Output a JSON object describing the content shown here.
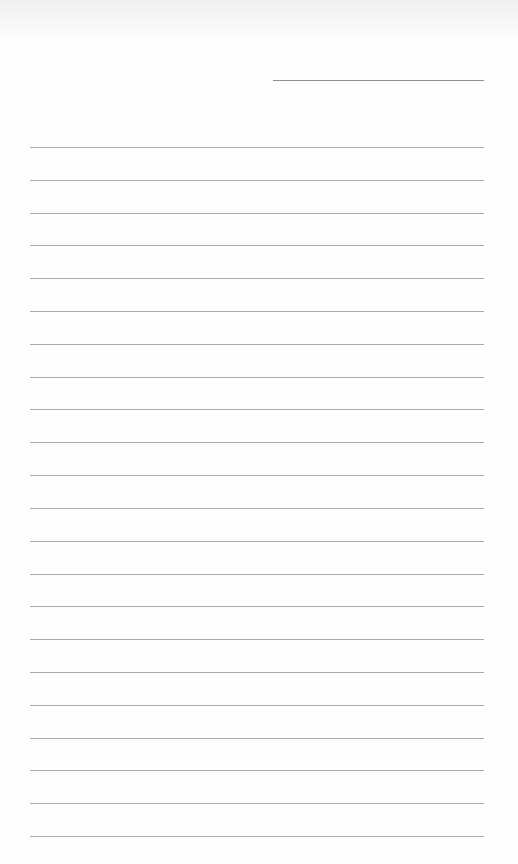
{
  "page": {
    "type": "lined-paper",
    "header_line_count": 1,
    "ruled_line_count": 22,
    "line_color": "#a9a9a9",
    "background_color": "#fdfdfd"
  }
}
